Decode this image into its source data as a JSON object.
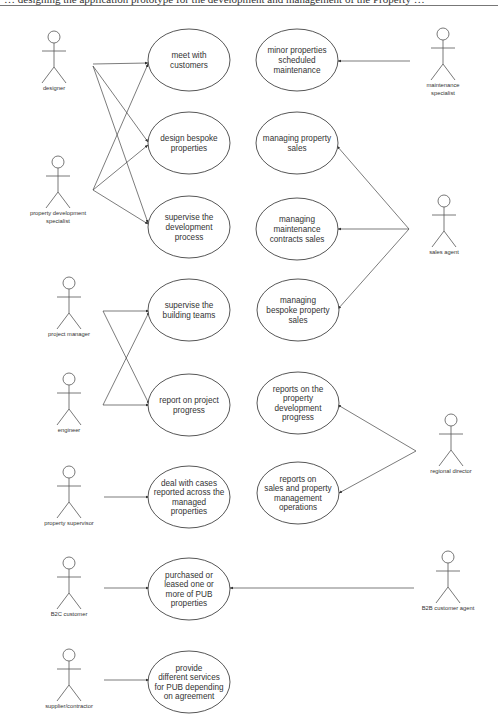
{
  "caption": {
    "text": "… designing the application prototype for the development and management of the Property …"
  },
  "diagram": {
    "type": "UML use case diagram",
    "colors": {
      "line": "#444444",
      "text": "#333333",
      "background": "#ffffff"
    },
    "actors": [
      {
        "id": "designer",
        "label": [
          "designer"
        ],
        "x": 54,
        "y": 31
      },
      {
        "id": "property_development_specialist",
        "label": [
          "property development",
          "specialist"
        ],
        "x": 58,
        "y": 156
      },
      {
        "id": "maintenance_specialist",
        "label": [
          "maintenance",
          "specialist"
        ],
        "x": 443,
        "y": 28
      },
      {
        "id": "sales_agent",
        "label": [
          "sales agent"
        ],
        "x": 444,
        "y": 195
      },
      {
        "id": "project_manager",
        "label": [
          "project manager"
        ],
        "x": 69,
        "y": 277
      },
      {
        "id": "engineer",
        "label": [
          "engineer"
        ],
        "x": 69,
        "y": 373
      },
      {
        "id": "regional_director",
        "label": [
          "regional director"
        ],
        "x": 451,
        "y": 414
      },
      {
        "id": "property_supervisor",
        "label": [
          "property supervisor"
        ],
        "x": 69,
        "y": 466
      },
      {
        "id": "b2c_customer",
        "label": [
          "B2C customer"
        ],
        "x": 69,
        "y": 557
      },
      {
        "id": "b2b_customer_agent",
        "label": [
          "B2B customer agent"
        ],
        "x": 448,
        "y": 551
      },
      {
        "id": "supplier_contractor",
        "label": [
          "supplier/contractor"
        ],
        "x": 69,
        "y": 649
      }
    ],
    "use_cases": [
      {
        "id": "meet_customers",
        "lines": [
          "meet with",
          "customers"
        ],
        "cx": 189,
        "cy": 60
      },
      {
        "id": "design_bespoke",
        "lines": [
          "design bespoke",
          "properties"
        ],
        "cx": 189,
        "cy": 143
      },
      {
        "id": "supervise_development",
        "lines": [
          "supervise the",
          "development",
          "process"
        ],
        "cx": 189,
        "cy": 227
      },
      {
        "id": "supervise_building",
        "lines": [
          "supervise the",
          "building teams"
        ],
        "cx": 189,
        "cy": 310
      },
      {
        "id": "report_progress",
        "lines": [
          "report on project",
          "progress"
        ],
        "cx": 189,
        "cy": 405
      },
      {
        "id": "deal_cases",
        "lines": [
          "deal with cases",
          "reported across the",
          "managed",
          "properties"
        ],
        "cx": 189,
        "cy": 497
      },
      {
        "id": "purchased_leased",
        "lines": [
          "purchased or",
          "leased one or",
          "more of PUB",
          "properties"
        ],
        "cx": 189,
        "cy": 589
      },
      {
        "id": "provide_services",
        "lines": [
          "provide",
          "different services",
          "for PUB depending",
          "on agreement"
        ],
        "cx": 189,
        "cy": 682
      },
      {
        "id": "minor_maintenance",
        "lines": [
          "minor properties",
          "scheduled",
          "maintenance"
        ],
        "cx": 297,
        "cy": 60
      },
      {
        "id": "property_sales",
        "lines": [
          "managing property",
          "sales"
        ],
        "cx": 297,
        "cy": 143
      },
      {
        "id": "maintenance_contracts",
        "lines": [
          "managing",
          "maintenance",
          "contracts sales"
        ],
        "cx": 297,
        "cy": 229
      },
      {
        "id": "bespoke_sales",
        "lines": [
          "managing",
          "bespoke property",
          "sales"
        ],
        "cx": 298,
        "cy": 310
      },
      {
        "id": "reports_development",
        "lines": [
          "reports on the",
          "property",
          "development",
          "progress"
        ],
        "cx": 298,
        "cy": 403
      },
      {
        "id": "reports_sales",
        "lines": [
          "reports on",
          "sales and property",
          "management",
          "operations"
        ],
        "cx": 298,
        "cy": 493
      }
    ],
    "associations": [
      {
        "from": "designer",
        "to": "meet_customers"
      },
      {
        "from": "designer",
        "to": "design_bespoke"
      },
      {
        "from": "designer",
        "to": "supervise_development"
      },
      {
        "from": "property_development_specialist",
        "to": "meet_customers"
      },
      {
        "from": "property_development_specialist",
        "to": "design_bespoke"
      },
      {
        "from": "property_development_specialist",
        "to": "supervise_development"
      },
      {
        "from": "maintenance_specialist",
        "to": "minor_maintenance"
      },
      {
        "from": "sales_agent",
        "to": "property_sales"
      },
      {
        "from": "sales_agent",
        "to": "maintenance_contracts"
      },
      {
        "from": "sales_agent",
        "to": "bespoke_sales"
      },
      {
        "from": "project_manager",
        "to": "supervise_building"
      },
      {
        "from": "project_manager",
        "to": "report_progress"
      },
      {
        "from": "engineer",
        "to": "supervise_building"
      },
      {
        "from": "engineer",
        "to": "report_progress"
      },
      {
        "from": "regional_director",
        "to": "reports_development"
      },
      {
        "from": "regional_director",
        "to": "reports_sales"
      },
      {
        "from": "property_supervisor",
        "to": "deal_cases"
      },
      {
        "from": "b2c_customer",
        "to": "purchased_leased"
      },
      {
        "from": "b2b_customer_agent",
        "to": "purchased_leased"
      },
      {
        "from": "supplier_contractor",
        "to": "provide_services"
      }
    ]
  }
}
